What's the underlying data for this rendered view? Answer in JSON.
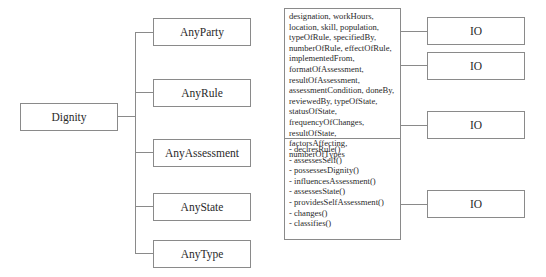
{
  "diagram": {
    "root": {
      "label": "Dignity"
    },
    "children": [
      {
        "label": "AnyParty"
      },
      {
        "label": "AnyRule"
      },
      {
        "label": "AnyAssessment"
      },
      {
        "label": "AnyState"
      },
      {
        "label": "AnyType"
      }
    ],
    "class_box": {
      "attributes": "designation, workHours, location, skill, population, typeOfRule, specifiedBy, numberOfRule, effectOfRule, implementedFrom, formatOfAssessment, resultOfAssessment, assessmentCondition, doneBy, reviewedBy, typeOfState, statusOfState, frequencyOfChanges, resultOfState, factorsAffecting, numberOfTypes",
      "operations": [
        "- declresRule()",
        "- assessesSelf()",
        "- possessesDignity()",
        "- influencesAssessment()",
        "- assessesState()",
        "- providesSelfAssessment()",
        "- changes()",
        "- classifies()"
      ]
    },
    "io_boxes": [
      {
        "label": "IO"
      },
      {
        "label": "IO"
      },
      {
        "label": "IO"
      },
      {
        "label": "IO"
      }
    ],
    "line_color": "#8a8a8a"
  }
}
